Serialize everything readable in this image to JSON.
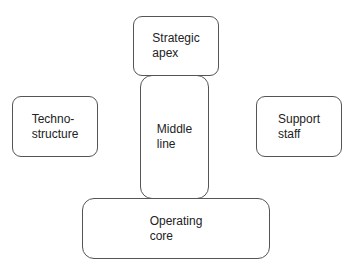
{
  "diagram": {
    "type": "organizational-structure",
    "stroke_color": "#555555",
    "fill_color": "#ffffff",
    "text_color": "#222222",
    "nodes": [
      {
        "id": "strategic-apex",
        "label": "Strategic\napex",
        "position": "top-center"
      },
      {
        "id": "middle-line",
        "label": "Middle\nline",
        "position": "center"
      },
      {
        "id": "operating-core",
        "label": "Operating\ncore",
        "position": "bottom-center"
      },
      {
        "id": "techno-structure",
        "label": "Techno-\nstructure",
        "position": "left"
      },
      {
        "id": "support-staff",
        "label": "Support\nstaff",
        "position": "right"
      }
    ]
  }
}
